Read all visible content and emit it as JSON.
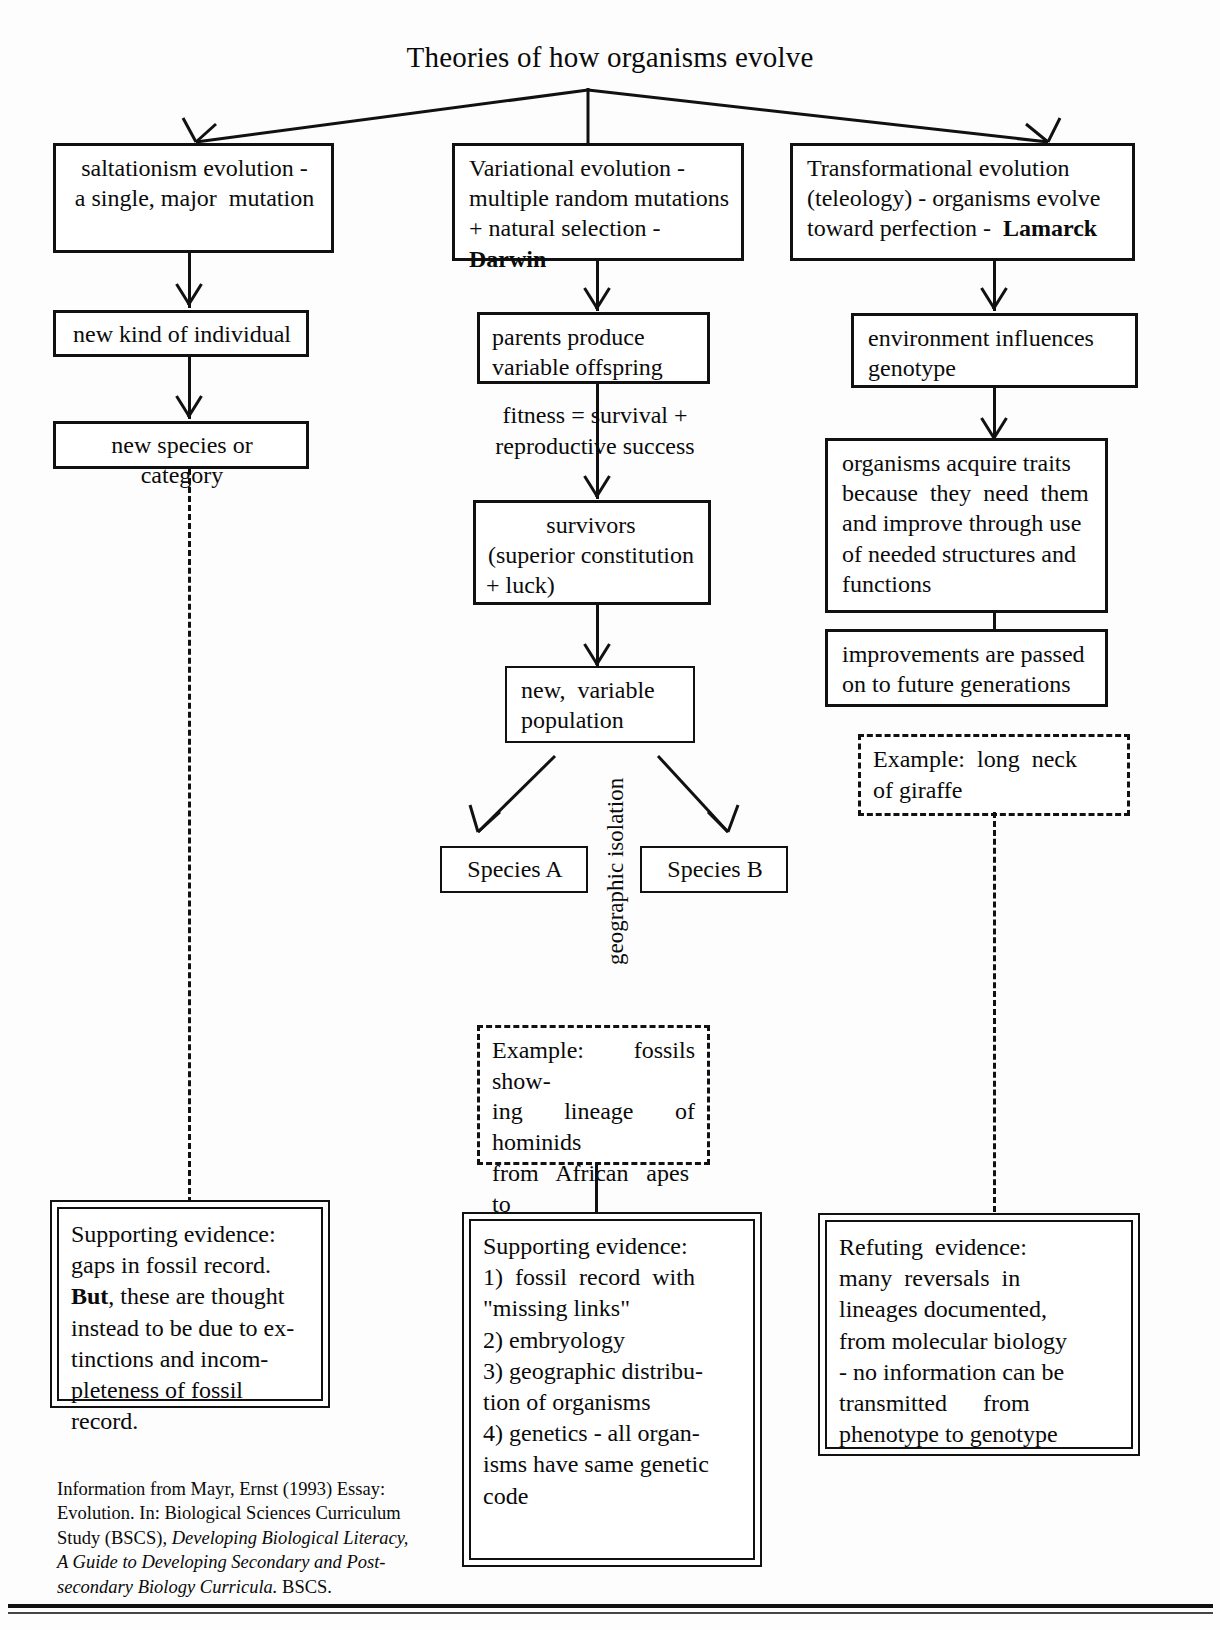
{
  "document": {
    "top_fragment": "Appendix",
    "title": "Theories of how organisms evolve"
  },
  "columns": {
    "left": {
      "root": "saltationism evolution -\na single, major  mutation",
      "steps": [
        "new kind of individual",
        "new species or category"
      ],
      "evidence": {
        "lines": [
          "Supporting evidence:",
          "gaps in fossil record.",
          "But, these are thought",
          "instead to be due to ex-",
          "tinctions and incom-",
          "pleteness of fossil",
          "record."
        ],
        "bold_word": "But"
      }
    },
    "middle": {
      "root_lines": [
        "Variational evolution -",
        "multiple random mutations",
        "+ natural selection - Darwin"
      ],
      "root_bold": "Darwin",
      "steps": [
        "parents produce\nvariable offspring",
        "survivors\n(superior constitution\n+ luck)",
        "new, variable\npopulation"
      ],
      "free_text": "fitness = survival +\nreproductive success",
      "species": [
        "Species A",
        "Species B"
      ],
      "isolation_label": "geographic isolation",
      "example": "Example: fossils show-\ning lineage of hominids\nfrom African apes to\nhumans",
      "evidence": [
        "Supporting evidence:",
        "1) fossil record with",
        "\"missing links\"",
        "2) embryology",
        "3) geographic distribu-",
        "tion of organisms",
        "4) genetics - all organ-",
        "isms have same genetic",
        "code"
      ]
    },
    "right": {
      "root_lines": [
        "Transformational evolution",
        "(teleology) - organisms evolve",
        "toward perfection -  Lamarck"
      ],
      "root_bold": "Lamarck",
      "steps": [
        "environment influences\ngenotype",
        "organisms acquire traits\nbecause they need them\nand improve through use\nof needed structures and\nfunctions",
        "improvements are passed\non to future generations"
      ],
      "example": "Example: long neck\nof giraffe",
      "evidence": [
        "Refuting evidence:",
        "many reversals in",
        "lineages documented,",
        "from molecular biology",
        "- no information can be",
        "transmitted      from",
        "phenotype to genotype"
      ]
    }
  },
  "citation": {
    "line1": "Information from Mayr, Ernst  (1993)  Essay:",
    "line2": "Evolution.  In: Biological Sciences Curriculum",
    "line3_plain": "Study (BSCS), ",
    "line3_italic": "Developing Biological Literacy,",
    "line4_italic": "A Guide to Developing Secondary and Post-",
    "line5_italic": "secondary Biology Curricula.",
    "line5_plain": "  BSCS."
  },
  "colors": {
    "ink": "#111111",
    "paper": "#fdfdfd"
  }
}
